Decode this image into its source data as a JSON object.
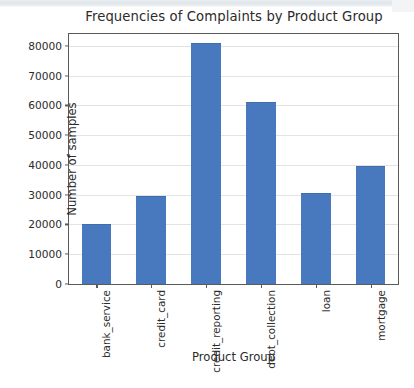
{
  "chart_data": {
    "type": "bar",
    "title": "Frequencies of Complaints by Product Group",
    "xlabel": "Product Group",
    "ylabel": "Number of samples",
    "categories": [
      "bank_service",
      "credit_card",
      "credit_reporting",
      "debt_collection",
      "loan",
      "mortgage"
    ],
    "values": [
      20000,
      29500,
      81000,
      61000,
      30500,
      39500
    ],
    "ylim": [
      0,
      84000
    ],
    "yticks": [
      0,
      10000,
      20000,
      30000,
      40000,
      50000,
      60000,
      70000,
      80000
    ],
    "ytick_labels": [
      "0",
      "10000",
      "20000",
      "30000",
      "40000",
      "50000",
      "60000",
      "70000",
      "80000"
    ],
    "grid": "horizontal",
    "legend": "none",
    "bar_color": "#4878bd"
  },
  "axis": {
    "y_label": "Number of samples",
    "x_label": "Product Group"
  }
}
